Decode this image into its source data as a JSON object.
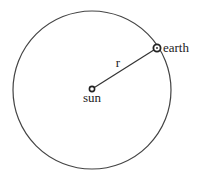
{
  "diagram": {
    "labels": {
      "earth": "earth",
      "sun": "sun",
      "radius": "r"
    },
    "orbit": {
      "cx": 92,
      "cy": 90,
      "r": 79
    },
    "sun_pos": {
      "x": 92,
      "y": 89
    },
    "earth_pos": {
      "x": 157,
      "y": 48
    },
    "colors": {
      "stroke": "#333333",
      "background": "#ffffff"
    }
  }
}
